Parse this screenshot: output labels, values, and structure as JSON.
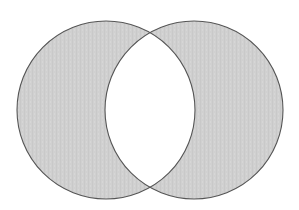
{
  "diagram": {
    "type": "venn-symmetric-difference",
    "sets": [
      {
        "name": "left-set",
        "cx": 106,
        "cy": 110,
        "r": 89
      },
      {
        "name": "right-set",
        "cx": 194,
        "cy": 110,
        "r": 89
      }
    ],
    "shaded_regions": [
      "left-only",
      "right-only"
    ],
    "unshaded_regions": [
      "intersection"
    ],
    "colors": {
      "fill": "#d0d0d0",
      "stroke": "#555555",
      "background": "#ffffff"
    }
  }
}
